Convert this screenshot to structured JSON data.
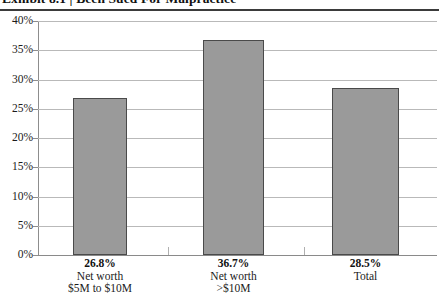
{
  "title": "Exhibit 8.1 | Been Sued For Malpractice",
  "chart_data": {
    "type": "bar",
    "title": "Exhibit 8.1 | Been Sued For Malpractice",
    "xlabel": "",
    "ylabel": "",
    "categories": [
      "Net worth $5M to $10M",
      "Net worth >$10M",
      "Total"
    ],
    "category_lines": [
      [
        "Net worth",
        "$5M to $10M"
      ],
      [
        "Net worth",
        ">$10M"
      ],
      [
        "Total",
        ""
      ]
    ],
    "values": [
      26.8,
      36.7,
      28.5
    ],
    "value_labels": [
      "26.8%",
      "36.7%",
      "28.5%"
    ],
    "ylim": [
      0,
      40
    ],
    "ytick_values": [
      40,
      35,
      30,
      25,
      20,
      15,
      10,
      5,
      0
    ],
    "ytick_labels": [
      "40%",
      "35%",
      "30%",
      "25%",
      "20%",
      "15%",
      "10%",
      "5%",
      "0%"
    ],
    "grid": true,
    "legend": "none",
    "bar_fill_color": "#9a9a9a",
    "bar_border_color": "#4a4a4a",
    "gridline_color": "#b9b9b9",
    "axis_color": "#8d8d8d"
  }
}
